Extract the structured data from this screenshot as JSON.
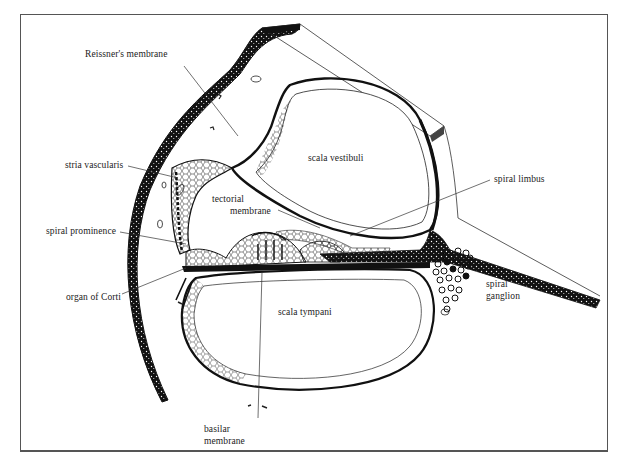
{
  "diagram": {
    "frame_color": "#555555",
    "ink_color": "#111111",
    "labels": {
      "reissners_membrane": "Reissner's membrane",
      "stria_vascularis": "stria vascularis",
      "spiral_prominence": "spiral prominence",
      "organ_of_corti": "organ of Corti",
      "basilar_membrane_line1": "basilar",
      "basilar_membrane_line2": "membrane",
      "scala_vestibuli": "scala vestibuli",
      "tectorial_membrane_line1": "tectorial",
      "tectorial_membrane_line2": "membrane",
      "scala_tympani": "scala tympani",
      "spiral_limbus": "spiral limbus",
      "spiral_ganglion_line1": "spiral",
      "spiral_ganglion_line2": "ganglion"
    }
  }
}
